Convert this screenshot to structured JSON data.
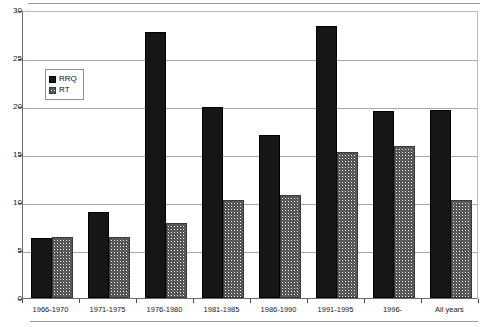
{
  "chart_data": {
    "type": "bar",
    "title": "",
    "subtitle": "",
    "xlabel": "",
    "ylabel": "",
    "categories": [
      "1966-1970",
      "1971-1975",
      "1976-1980",
      "1981-1985",
      "1986-1990",
      "1991-1995",
      "1996-",
      "All years"
    ],
    "series": [
      {
        "name": "RRQ",
        "values": [
          6.3,
          9.0,
          27.7,
          19.9,
          17.0,
          28.3,
          19.5,
          19.6
        ],
        "color": "#161616",
        "fill": "solid"
      },
      {
        "name": "RT",
        "values": [
          6.4,
          6.4,
          7.8,
          10.2,
          10.7,
          15.2,
          15.8,
          10.2
        ],
        "color": "#707070",
        "fill": "hatched"
      }
    ],
    "ylim": [
      0,
      30
    ],
    "yticks": [
      0,
      5,
      10,
      15,
      20,
      25,
      30
    ],
    "ytick_labels": [
      "0",
      "5",
      "10",
      "15",
      "20",
      "25",
      "30"
    ],
    "grid": true,
    "grid_axis": "y",
    "legend": {
      "position": "upper-left-inside",
      "entries": [
        "RRQ",
        "RT"
      ]
    }
  },
  "legend": {
    "entries": [
      {
        "label": "RRQ",
        "swatch": "solid-black-square-icon"
      },
      {
        "label": "RT",
        "swatch": "hatched-square-icon"
      }
    ]
  }
}
